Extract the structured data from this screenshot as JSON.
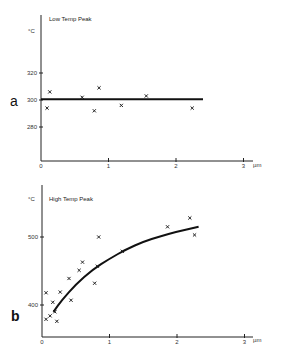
{
  "chart_data": [
    {
      "type": "scatter",
      "panel": "a",
      "title": "Low Temp Peak",
      "ylabel": "°C",
      "xlabel": "µm",
      "xlim": [
        0,
        3.2
      ],
      "ylim": [
        255,
        345
      ],
      "x_ticks": [
        0,
        1,
        2,
        3
      ],
      "y_ticks": [
        280,
        300,
        320
      ],
      "grid": false,
      "series": [
        {
          "name": "measurements",
          "marker": "x",
          "points": [
            [
              0.09,
              294
            ],
            [
              0.13,
              306
            ],
            [
              0.61,
              302
            ],
            [
              0.79,
              292
            ],
            [
              0.86,
              309
            ],
            [
              1.19,
              296
            ],
            [
              1.56,
              303
            ],
            [
              2.24,
              294
            ]
          ]
        },
        {
          "name": "fit",
          "style": "line",
          "points": [
            [
              0,
              300.5
            ],
            [
              2.4,
              300.5
            ]
          ]
        }
      ]
    },
    {
      "type": "scatter",
      "panel": "b",
      "title": "High Temp Peak",
      "ylabel": "°C",
      "xlabel": "µm",
      "xlim": [
        0,
        3.2
      ],
      "ylim": [
        353,
        560
      ],
      "x_ticks": [
        0,
        1,
        2,
        3
      ],
      "y_ticks": [
        400,
        500
      ],
      "grid": false,
      "series": [
        {
          "name": "measurements",
          "marker": "x",
          "points": [
            [
              0.06,
              418
            ],
            [
              0.06,
              379
            ],
            [
              0.12,
              384
            ],
            [
              0.16,
              404
            ],
            [
              0.19,
              390
            ],
            [
              0.22,
              376
            ],
            [
              0.27,
              419
            ],
            [
              0.4,
              439
            ],
            [
              0.43,
              407
            ],
            [
              0.55,
              451
            ],
            [
              0.6,
              463
            ],
            [
              0.78,
              432
            ],
            [
              0.82,
              457
            ],
            [
              0.84,
              500
            ],
            [
              1.19,
              479
            ],
            [
              1.86,
              515
            ],
            [
              2.19,
              528
            ],
            [
              2.26,
              503
            ]
          ]
        },
        {
          "name": "fit",
          "style": "curve",
          "points": [
            [
              0.17,
              390
            ],
            [
              0.3,
              408
            ],
            [
              0.5,
              430
            ],
            [
              0.75,
              452
            ],
            [
              1.0,
              468
            ],
            [
              1.25,
              482
            ],
            [
              1.5,
              493
            ],
            [
              1.75,
              501
            ],
            [
              2.0,
              508
            ],
            [
              2.32,
              515
            ]
          ]
        }
      ]
    }
  ]
}
